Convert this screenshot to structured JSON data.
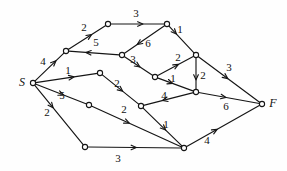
{
  "figure": {
    "type": "directed-weighted-graph",
    "width": 287,
    "height": 171,
    "background_color": "#fefefe",
    "stroke_color": "#151515"
  },
  "chart_data": {
    "type": "diagram",
    "title": "",
    "nodes": [
      {
        "id": "S",
        "label": "S",
        "x": 33,
        "y": 83,
        "terminal": true,
        "label_dx": -11,
        "label_dy": 0
      },
      {
        "id": "a",
        "label": "",
        "x": 66,
        "y": 51,
        "terminal": false,
        "label_dx": 0,
        "label_dy": 0
      },
      {
        "id": "b",
        "label": "",
        "x": 108,
        "y": 24,
        "terminal": false,
        "label_dx": 0,
        "label_dy": 0
      },
      {
        "id": "c",
        "label": "",
        "x": 167,
        "y": 24,
        "terminal": false,
        "label_dx": 0,
        "label_dy": 0
      },
      {
        "id": "d",
        "label": "",
        "x": 122,
        "y": 55,
        "terminal": false,
        "label_dx": 0,
        "label_dy": 0
      },
      {
        "id": "e",
        "label": "",
        "x": 196,
        "y": 55,
        "terminal": false,
        "label_dx": 0,
        "label_dy": 0
      },
      {
        "id": "f",
        "label": "",
        "x": 155,
        "y": 77,
        "terminal": false,
        "label_dx": 0,
        "label_dy": 0
      },
      {
        "id": "g",
        "label": "",
        "x": 100,
        "y": 73,
        "terminal": false,
        "label_dx": 0,
        "label_dy": 0
      },
      {
        "id": "h",
        "label": "",
        "x": 196,
        "y": 92,
        "terminal": false,
        "label_dx": 0,
        "label_dy": 0
      },
      {
        "id": "i",
        "label": "",
        "x": 89,
        "y": 105,
        "terminal": false,
        "label_dx": 0,
        "label_dy": 0
      },
      {
        "id": "j",
        "label": "",
        "x": 141,
        "y": 106,
        "terminal": false,
        "label_dx": 0,
        "label_dy": 0
      },
      {
        "id": "k",
        "label": "",
        "x": 85,
        "y": 147,
        "terminal": false,
        "label_dx": 0,
        "label_dy": 0
      },
      {
        "id": "m",
        "label": "",
        "x": 184,
        "y": 148,
        "terminal": false,
        "label_dx": 0,
        "label_dy": 0
      },
      {
        "id": "F",
        "label": "F",
        "x": 262,
        "y": 104,
        "terminal": true,
        "label_dx": 11,
        "label_dy": 0
      }
    ],
    "edges": [
      {
        "from": "S",
        "to": "a",
        "weight": "4",
        "lx": 43,
        "ly": 62,
        "arrow_at": 0.72
      },
      {
        "from": "a",
        "to": "b",
        "weight": "2",
        "lx": 84,
        "ly": 28,
        "arrow_at": 0.62
      },
      {
        "from": "b",
        "to": "c",
        "weight": "3",
        "lx": 136,
        "ly": 14,
        "arrow_at": 0.6
      },
      {
        "from": "d",
        "to": "a",
        "weight": "5",
        "lx": 96,
        "ly": 43,
        "arrow_at": 0.66
      },
      {
        "from": "c",
        "to": "d",
        "weight": "6",
        "lx": 148,
        "ly": 44,
        "arrow_at": 0.68
      },
      {
        "from": "c",
        "to": "e",
        "weight": "1",
        "lx": 180,
        "ly": 30,
        "arrow_at": 0.3
      },
      {
        "from": "d",
        "to": "f",
        "weight": "3",
        "lx": 133,
        "ly": 60,
        "arrow_at": 0.55
      },
      {
        "from": "f",
        "to": "e",
        "weight": "2",
        "lx": 178,
        "ly": 58,
        "arrow_at": 0.58
      },
      {
        "from": "e",
        "to": "h",
        "weight": "2",
        "lx": 203,
        "ly": 76,
        "arrow_at": 0.7
      },
      {
        "from": "e",
        "to": "F",
        "weight": "3",
        "lx": 229,
        "ly": 68,
        "arrow_at": 0.48
      },
      {
        "from": "f",
        "to": "h",
        "weight": "1",
        "lx": 173,
        "ly": 79,
        "arrow_at": 0.42
      },
      {
        "from": "S",
        "to": "g",
        "weight": "1",
        "lx": 68,
        "ly": 71,
        "arrow_at": 0.62
      },
      {
        "from": "g",
        "to": "j",
        "weight": "2",
        "lx": 117,
        "ly": 84,
        "arrow_at": 0.56
      },
      {
        "from": "h",
        "to": "j",
        "weight": "4",
        "lx": 164,
        "ly": 96,
        "arrow_at": 0.62
      },
      {
        "from": "h",
        "to": "F",
        "weight": "6",
        "lx": 226,
        "ly": 107,
        "arrow_at": 0.45
      },
      {
        "from": "S",
        "to": "i",
        "weight": "5",
        "lx": 62,
        "ly": 96,
        "arrow_at": 0.55
      },
      {
        "from": "i",
        "to": "m",
        "weight": "2",
        "lx": 124,
        "ly": 110,
        "arrow_at": 0.42
      },
      {
        "from": "S",
        "to": "k",
        "weight": "2",
        "lx": 47,
        "ly": 113,
        "arrow_at": 0.38
      },
      {
        "from": "j",
        "to": "m",
        "weight": "1",
        "lx": 166,
        "ly": 125,
        "arrow_at": 0.58
      },
      {
        "from": "k",
        "to": "m",
        "weight": "3",
        "lx": 118,
        "ly": 159,
        "arrow_at": 0.52
      },
      {
        "from": "m",
        "to": "F",
        "weight": "4",
        "lx": 207,
        "ly": 141,
        "arrow_at": 0.42
      }
    ]
  }
}
